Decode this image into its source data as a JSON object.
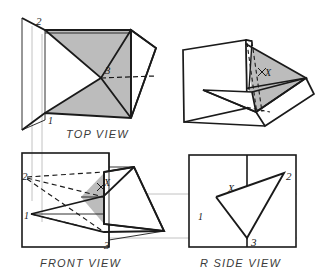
{
  "drawing": {
    "title_implicit": "Orthographic projection of an oblique plane with piercing point",
    "canvas": {
      "width": 319,
      "height": 279
    },
    "colors": {
      "background": "#ffffff",
      "line": "#1a1a1a",
      "shade_fill": "#b8b8b8",
      "projection_line": "#bdbdbd",
      "label_text": "#3a3a3a"
    },
    "line_weights": {
      "visible": 1.7,
      "thin": 0.9,
      "hidden_dash": 1.1,
      "projection": 1.0
    }
  },
  "views": {
    "top": {
      "label": "TOP VIEW",
      "label_x": 95,
      "label_y": 136,
      "point_labels": [
        {
          "name": "2",
          "x": 38,
          "y": 22
        },
        {
          "name": "3",
          "x": 109,
          "y": 72
        },
        {
          "name": "1",
          "x": 49,
          "y": 120
        }
      ]
    },
    "front": {
      "label": "FRONT VIEW",
      "label_x": 75,
      "label_y": 265,
      "point_labels": [
        {
          "name": "2",
          "x": 26,
          "y": 176
        },
        {
          "name": "X",
          "x": 104,
          "y": 188
        },
        {
          "name": "1",
          "x": 28,
          "y": 215
        },
        {
          "name": "3",
          "x": 107,
          "y": 245
        }
      ]
    },
    "rside": {
      "label": "R SIDE VIEW",
      "label_x": 240,
      "label_y": 265,
      "point_labels": [
        {
          "name": "X",
          "x": 231,
          "y": 188
        },
        {
          "name": "2",
          "x": 288,
          "y": 178
        },
        {
          "name": "1",
          "x": 200,
          "y": 216
        },
        {
          "name": "3",
          "x": 254,
          "y": 243
        }
      ]
    },
    "pictorial": {
      "label": "",
      "point_labels": [
        {
          "name": "X",
          "x": 264,
          "y": 72
        }
      ]
    }
  },
  "geometry": {
    "top_view": {
      "back_panel": "22,18 22,130 45,120 45,30",
      "top_face": "45,30 131,30 156,48 131,58 45,30",
      "plane_upper": "45,30 101,78 131,30",
      "plane_lower": "45,113 101,78 131,118",
      "shade_upper": "45,30 131,30 101,78",
      "shade_lower": "45,113 101,78 131,118 131,30 101,78",
      "right_wedge": "131,30 156,48 131,118",
      "fold_outer": "131,30 131,118",
      "hidden": "101,78 156,76",
      "outer_edges": "22,18 45,30 131,30 156,48 131,118 45,113 22,130"
    },
    "front_view": {
      "box": "22,153 109,153 109,247 22,247",
      "plane": "26,180 104,196 104,224 109,240",
      "wedge": "104,172 134,166 164,230 104,224",
      "shade": "81,196 104,196 104,224 81,210",
      "hidden_edges": [
        "26,180 104,180",
        "26,180 104,196",
        "26,180 104,232",
        "31,214 104,232"
      ]
    },
    "r_side_view": {
      "box": "189,155 296,155 296,247 189,247",
      "fold_line": "247,155 247,247",
      "triangle": "216,197 284,173 247,238",
      "apex_lines": "216,197 284,173 247,238 216,197"
    },
    "projection_lines": {
      "vertical": [
        {
          "x": 32,
          "y1": 28,
          "y2": 200
        },
        {
          "x": 42,
          "y1": 36,
          "y2": 220
        }
      ],
      "horizontal": [
        {
          "y": 194,
          "x1": 104,
          "x2": 296
        },
        {
          "y": 238,
          "x1": 109,
          "x2": 296
        }
      ]
    }
  }
}
